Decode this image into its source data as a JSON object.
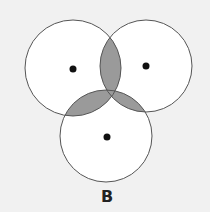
{
  "figure": {
    "label": "B",
    "background": "#f1f1f1",
    "circle_fill": "#ffffff",
    "circle_stroke": "#555555",
    "overlap_fill": "#9a9a9a",
    "dot_color": "#111111"
  },
  "circles": [
    {
      "name": "left",
      "cx": 73,
      "cy": 68,
      "r": 48
    },
    {
      "name": "right",
      "cx": 146,
      "cy": 66,
      "r": 46
    },
    {
      "name": "bottom",
      "cx": 106,
      "cy": 136,
      "r": 46
    }
  ],
  "shaded_regions": [
    "left ∩ right",
    "left ∩ bottom",
    "right ∩ bottom"
  ]
}
